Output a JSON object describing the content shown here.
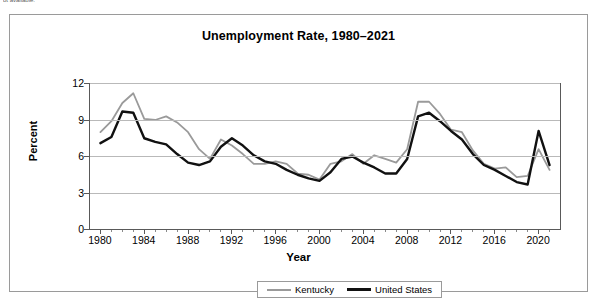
{
  "page_fragment": "ot available.",
  "chart": {
    "title": "Unemployment Rate, 1980–2021",
    "x_axis_title": "Year",
    "y_axis_title": "Percent",
    "legend": [
      {
        "label": "Kentucky",
        "color": "#9a9a9a",
        "key": "kentucky"
      },
      {
        "label": "United States",
        "color": "#111111",
        "key": "us"
      }
    ]
  },
  "chart_data": {
    "type": "line",
    "title": "Unemployment Rate, 1980–2021",
    "xlabel": "Year",
    "ylabel": "Percent",
    "xlim": [
      1979,
      2022
    ],
    "ylim": [
      0,
      12
    ],
    "yticks": [
      0,
      3,
      6,
      9,
      12
    ],
    "xticks": [
      1980,
      1984,
      1988,
      1992,
      1996,
      2000,
      2004,
      2008,
      2012,
      2016,
      2020
    ],
    "grid": "horizontal",
    "legend_position": "bottom",
    "x": [
      1980,
      1981,
      1982,
      1983,
      1984,
      1985,
      1986,
      1987,
      1988,
      1989,
      1990,
      1991,
      1992,
      1993,
      1994,
      1995,
      1996,
      1997,
      1998,
      1999,
      2000,
      2001,
      2002,
      2003,
      2004,
      2005,
      2006,
      2007,
      2008,
      2009,
      2010,
      2011,
      2012,
      2013,
      2014,
      2015,
      2016,
      2017,
      2018,
      2019,
      2020,
      2021
    ],
    "series": [
      {
        "name": "Kentucky",
        "color": "#9a9a9a",
        "values": [
          8.0,
          8.9,
          10.4,
          11.2,
          9.1,
          9.0,
          9.3,
          8.8,
          8.0,
          6.6,
          5.8,
          7.4,
          6.9,
          6.2,
          5.4,
          5.4,
          5.6,
          5.4,
          4.6,
          4.5,
          4.1,
          5.4,
          5.6,
          6.2,
          5.4,
          6.1,
          5.8,
          5.5,
          6.6,
          10.5,
          10.5,
          9.5,
          8.2,
          8.0,
          6.5,
          5.4,
          5.0,
          5.1,
          4.3,
          4.4,
          6.6,
          4.9
        ]
      },
      {
        "name": "United States",
        "color": "#111111",
        "values": [
          7.1,
          7.6,
          9.7,
          9.6,
          7.5,
          7.2,
          7.0,
          6.2,
          5.5,
          5.3,
          5.6,
          6.8,
          7.5,
          6.9,
          6.1,
          5.6,
          5.4,
          4.9,
          4.5,
          4.2,
          4.0,
          4.7,
          5.8,
          6.0,
          5.5,
          5.1,
          4.6,
          4.6,
          5.8,
          9.3,
          9.6,
          8.9,
          8.1,
          7.4,
          6.2,
          5.3,
          4.9,
          4.4,
          3.9,
          3.7,
          8.1,
          5.3
        ]
      }
    ]
  }
}
